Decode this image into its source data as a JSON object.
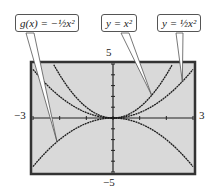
{
  "chart_data": {
    "type": "line",
    "title": "",
    "xlabel": "",
    "ylabel": "",
    "xlim": [
      -3,
      3
    ],
    "ylim": [
      -5,
      5
    ],
    "grid": false,
    "axis_labels": {
      "xmin": "−3",
      "xmax": "3",
      "ymax": "5",
      "ymin": "−5"
    },
    "series": [
      {
        "name": "y = x²",
        "expr": "x^2",
        "x": [
          -3,
          -2.5,
          -2,
          -1.5,
          -1,
          -0.5,
          0,
          0.5,
          1,
          1.5,
          2,
          2.5,
          3
        ],
        "values": [
          9,
          6.25,
          4,
          2.25,
          1,
          0.25,
          0,
          0.25,
          1,
          2.25,
          4,
          6.25,
          9
        ]
      },
      {
        "name": "y = ½x²",
        "expr": "0.5*x^2",
        "x": [
          -3,
          -2.5,
          -2,
          -1.5,
          -1,
          -0.5,
          0,
          0.5,
          1,
          1.5,
          2,
          2.5,
          3
        ],
        "values": [
          4.5,
          3.125,
          2,
          1.125,
          0.5,
          0.125,
          0,
          0.125,
          0.5,
          1.125,
          2,
          3.125,
          4.5
        ]
      },
      {
        "name": "g(x) = −½x²",
        "expr": "-0.5*x^2",
        "x": [
          -3,
          -2.5,
          -2,
          -1.5,
          -1,
          -0.5,
          0,
          0.5,
          1,
          1.5,
          2,
          2.5,
          3
        ],
        "values": [
          -4.5,
          -3.125,
          -2,
          -1.125,
          -0.5,
          -0.125,
          0,
          -0.125,
          -0.5,
          -1.125,
          -2,
          -3.125,
          -4.5
        ]
      }
    ],
    "annotations": [
      "g(x) = −½x²",
      "y = x²",
      "y = ½x²"
    ]
  },
  "labels": {
    "g": "g(x) = −½x²",
    "y1": "y = x²",
    "y2": "y = ½x²"
  },
  "ticks": {
    "xmin": "−3",
    "xmax": "3",
    "ymax": "5",
    "ymin": "−5"
  },
  "colors": {
    "screen": "#d9d9d9",
    "border": "#333333",
    "curve": "#1a1a1a"
  }
}
